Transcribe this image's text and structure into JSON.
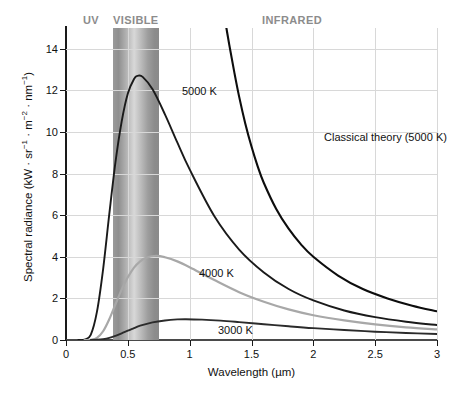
{
  "chart_data": {
    "type": "line",
    "title": "",
    "xlabel": "Wavelength (µm)",
    "ylabel": "Spectral radiance (kW · sr⁻¹ · m⁻² · nm⁻¹)",
    "ylabel_parts": {
      "main": "Spectral radiance (kW · sr",
      "sup1": "−1",
      "mid1": " · m",
      "sup2": "−2",
      "mid2": " · nm",
      "sup3": "−1",
      "tail": ")"
    },
    "xlim": [
      0,
      3
    ],
    "ylim": [
      0,
      15
    ],
    "grid": true,
    "legend": "none",
    "xticks": [
      "0",
      "0.5",
      "1",
      "1.5",
      "2",
      "2.5",
      "3"
    ],
    "xtick_values": [
      0,
      0.5,
      1,
      1.5,
      2,
      2.5,
      3
    ],
    "yticks": [
      "0",
      "2",
      "4",
      "6",
      "8",
      "10",
      "12",
      "14"
    ],
    "ytick_values": [
      0,
      2,
      4,
      6,
      8,
      10,
      12,
      14
    ],
    "regions": [
      {
        "name": "UV",
        "label": "UV",
        "range": [
          0,
          0.38
        ]
      },
      {
        "name": "VISIBLE",
        "label": "VISIBLE",
        "range": [
          0.38,
          0.75
        ]
      },
      {
        "name": "INFRARED",
        "label": "INFRARED",
        "range": [
          0.75,
          3.0
        ]
      }
    ],
    "series": [
      {
        "name": "5000 K",
        "label": "5000 K",
        "color": "#1a1a1a",
        "peak": {
          "x": 0.58,
          "y": 12.7
        },
        "points": [
          [
            0.1,
            0.0
          ],
          [
            0.15,
            0.02
          ],
          [
            0.2,
            0.25
          ],
          [
            0.25,
            1.35
          ],
          [
            0.3,
            3.4
          ],
          [
            0.35,
            6.05
          ],
          [
            0.4,
            8.55
          ],
          [
            0.45,
            10.5
          ],
          [
            0.5,
            11.85
          ],
          [
            0.55,
            12.55
          ],
          [
            0.58,
            12.7
          ],
          [
            0.62,
            12.65
          ],
          [
            0.7,
            12.05
          ],
          [
            0.8,
            10.85
          ],
          [
            0.9,
            9.5
          ],
          [
            1.0,
            8.2
          ],
          [
            1.2,
            5.95
          ],
          [
            1.4,
            4.35
          ],
          [
            1.6,
            3.25
          ],
          [
            1.8,
            2.45
          ],
          [
            2.0,
            1.9
          ],
          [
            2.25,
            1.42
          ],
          [
            2.5,
            1.1
          ],
          [
            2.75,
            0.88
          ],
          [
            3.0,
            0.72
          ]
        ]
      },
      {
        "name": "4000 K",
        "label": "4000 K",
        "color": "#a8a8a8",
        "peak": {
          "x": 0.73,
          "y": 4.05
        },
        "points": [
          [
            0.15,
            0.0
          ],
          [
            0.2,
            0.01
          ],
          [
            0.25,
            0.1
          ],
          [
            0.3,
            0.42
          ],
          [
            0.35,
            1.0
          ],
          [
            0.4,
            1.72
          ],
          [
            0.45,
            2.42
          ],
          [
            0.5,
            3.02
          ],
          [
            0.55,
            3.48
          ],
          [
            0.6,
            3.78
          ],
          [
            0.65,
            3.96
          ],
          [
            0.73,
            4.05
          ],
          [
            0.8,
            3.98
          ],
          [
            0.9,
            3.78
          ],
          [
            1.0,
            3.5
          ],
          [
            1.2,
            2.88
          ],
          [
            1.4,
            2.3
          ],
          [
            1.6,
            1.84
          ],
          [
            1.8,
            1.47
          ],
          [
            2.0,
            1.19
          ],
          [
            2.25,
            0.94
          ],
          [
            2.5,
            0.75
          ],
          [
            2.75,
            0.61
          ],
          [
            3.0,
            0.51
          ]
        ]
      },
      {
        "name": "3000 K",
        "label": "3000 K",
        "color": "#2b2b2b",
        "peak": {
          "x": 0.97,
          "y": 1.0
        },
        "points": [
          [
            0.2,
            0.0
          ],
          [
            0.25,
            0.01
          ],
          [
            0.3,
            0.04
          ],
          [
            0.35,
            0.1
          ],
          [
            0.4,
            0.2
          ],
          [
            0.45,
            0.32
          ],
          [
            0.5,
            0.45
          ],
          [
            0.55,
            0.57
          ],
          [
            0.6,
            0.69
          ],
          [
            0.7,
            0.85
          ],
          [
            0.8,
            0.94
          ],
          [
            0.9,
            0.99
          ],
          [
            0.97,
            1.0
          ],
          [
            1.1,
            0.98
          ],
          [
            1.25,
            0.93
          ],
          [
            1.4,
            0.86
          ],
          [
            1.6,
            0.76
          ],
          [
            1.8,
            0.66
          ],
          [
            2.0,
            0.57
          ],
          [
            2.25,
            0.48
          ],
          [
            2.5,
            0.4
          ],
          [
            2.75,
            0.34
          ],
          [
            3.0,
            0.29
          ]
        ]
      },
      {
        "name": "Classical theory (5000 K)",
        "label": "Classical theory (5000 K)",
        "color": "#0d0d0d",
        "points": [
          [
            1.28,
            15.6
          ],
          [
            1.32,
            14.2
          ],
          [
            1.36,
            12.9
          ],
          [
            1.4,
            11.7
          ],
          [
            1.45,
            10.4
          ],
          [
            1.5,
            9.3
          ],
          [
            1.55,
            8.35
          ],
          [
            1.6,
            7.55
          ],
          [
            1.7,
            6.3
          ],
          [
            1.8,
            5.35
          ],
          [
            1.9,
            4.6
          ],
          [
            2.0,
            4.0
          ],
          [
            2.2,
            3.1
          ],
          [
            2.4,
            2.45
          ],
          [
            2.6,
            2.0
          ],
          [
            2.8,
            1.65
          ],
          [
            3.0,
            1.38
          ]
        ]
      }
    ]
  },
  "caption": {
    "text": ""
  }
}
